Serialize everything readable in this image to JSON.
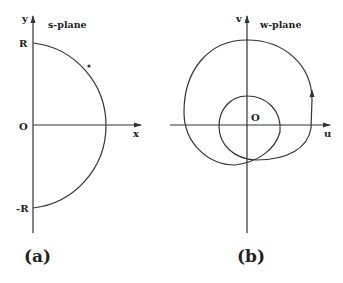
{
  "panel_a": {
    "title": "s-plane",
    "axis_x_label": "x",
    "axis_y_label": "y",
    "origin_label": "O",
    "top_label": "R",
    "bottom_label": "-R",
    "caption": "(a)",
    "contour": "semicircle of radius R in right half-plane, traversed counterclockwise (arrow on upper arc)"
  },
  "panel_b": {
    "title": "w-plane",
    "axis_x_label": "u",
    "axis_y_label": "v",
    "origin_label": "O",
    "caption": "(b)",
    "contour": "mapped contour: large loop encircling origin spiraling into a smaller loop around origin, arrow pointing upward on right side"
  },
  "colors": {
    "stroke": "#333333",
    "background": "#ffffff"
  }
}
